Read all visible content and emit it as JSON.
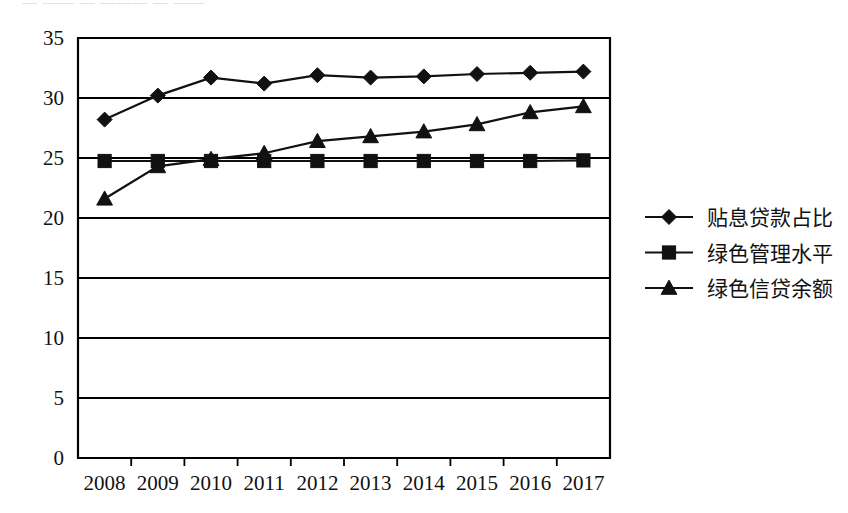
{
  "figure": {
    "cut_off_header_text": "— —— — ——— — ——",
    "background_color": "#ffffff",
    "ink_color": "#111111"
  },
  "chart_data": {
    "type": "line",
    "title": "",
    "xlabel": "",
    "ylabel": "",
    "categories": [
      "2008",
      "2009",
      "2010",
      "2011",
      "2012",
      "2013",
      "2014",
      "2015",
      "2016",
      "2017"
    ],
    "ylim": [
      0,
      35
    ],
    "yticks": [
      0,
      5,
      10,
      15,
      20,
      25,
      30,
      35
    ],
    "ytick_labels": [
      "0",
      "5",
      "10",
      "15",
      "20",
      "25",
      "30",
      "35"
    ],
    "grid": "horizontal",
    "legend_position": "right",
    "series": [
      {
        "name": "贴息贷款占比",
        "marker": "diamond",
        "color": "#111111",
        "values": [
          28.2,
          30.2,
          31.7,
          31.2,
          31.9,
          31.7,
          31.8,
          32.0,
          32.1,
          32.2
        ]
      },
      {
        "name": "绿色管理水平",
        "marker": "square",
        "color": "#111111",
        "values": [
          24.75,
          24.75,
          24.75,
          24.75,
          24.75,
          24.75,
          24.75,
          24.75,
          24.75,
          24.8
        ]
      },
      {
        "name": "绿色信贷余额",
        "marker": "triangle",
        "color": "#111111",
        "values": [
          21.6,
          24.3,
          24.9,
          25.4,
          26.4,
          26.8,
          27.2,
          27.8,
          28.8,
          29.3
        ]
      }
    ]
  },
  "legend": {
    "entries": [
      {
        "label": "贴息贷款占比",
        "marker": "diamond"
      },
      {
        "label": "绿色管理水平",
        "marker": "square"
      },
      {
        "label": "绿色信贷余额",
        "marker": "triangle"
      }
    ]
  }
}
